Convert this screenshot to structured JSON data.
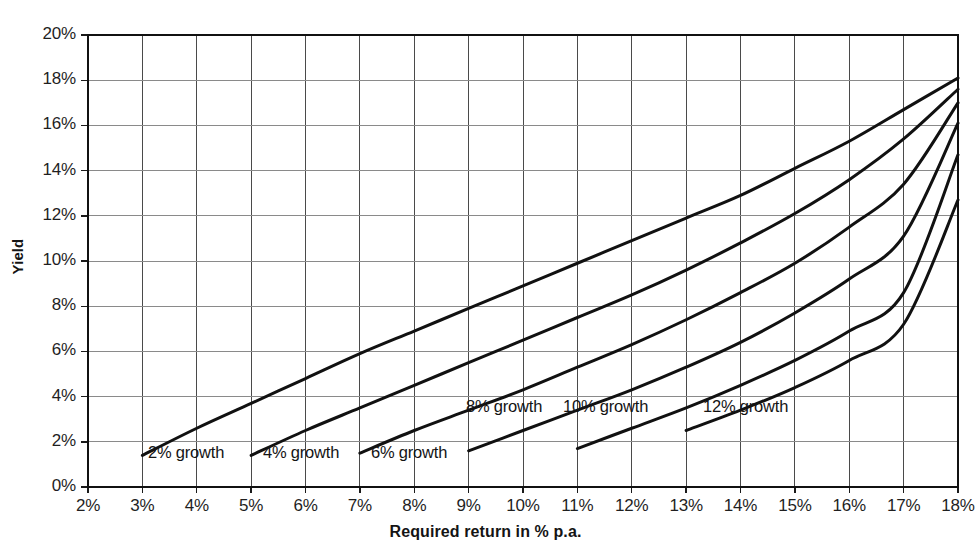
{
  "chart_data": {
    "type": "line",
    "title": "",
    "xlabel": "Required return in % p.a.",
    "ylabel": "Yield",
    "xlim": [
      2,
      18
    ],
    "ylim": [
      0,
      20
    ],
    "grid": true,
    "legend_position": "inline-labels",
    "x_tick_labels": [
      "2%",
      "3%",
      "4%",
      "5%",
      "6%",
      "7%",
      "8%",
      "9%",
      "10%",
      "11%",
      "12%",
      "13%",
      "14%",
      "15%",
      "16%",
      "17%",
      "18%"
    ],
    "y_tick_labels": [
      "0%",
      "2%",
      "4%",
      "6%",
      "8%",
      "10%",
      "12%",
      "14%",
      "16%",
      "18%",
      "20%"
    ],
    "x_ticks": [
      2,
      3,
      4,
      5,
      6,
      7,
      8,
      9,
      10,
      11,
      12,
      13,
      14,
      15,
      16,
      17,
      18
    ],
    "y_ticks": [
      0,
      2,
      4,
      6,
      8,
      10,
      12,
      14,
      16,
      18,
      20
    ],
    "series": [
      {
        "name": "2% growth",
        "label": "2% growth",
        "color": "#111111",
        "x": [
          3,
          4,
          5,
          6,
          7,
          8,
          9,
          10,
          11,
          12,
          13,
          14,
          15,
          16,
          17,
          18
        ],
        "values": [
          1.4,
          2.6,
          3.7,
          4.8,
          5.9,
          6.9,
          7.9,
          8.9,
          9.9,
          10.9,
          11.9,
          12.9,
          14.1,
          15.3,
          16.7,
          18.1
        ]
      },
      {
        "name": "4% growth",
        "label": "4% growth",
        "color": "#111111",
        "x": [
          5,
          6,
          7,
          8,
          9,
          10,
          11,
          12,
          13,
          14,
          15,
          16,
          17,
          18
        ],
        "values": [
          1.4,
          2.5,
          3.5,
          4.5,
          5.5,
          6.5,
          7.5,
          8.5,
          9.6,
          10.8,
          12.1,
          13.6,
          15.4,
          17.6
        ]
      },
      {
        "name": "6% growth",
        "label": "6% growth",
        "color": "#111111",
        "x": [
          7,
          8,
          9,
          10,
          11,
          12,
          13,
          14,
          15,
          16,
          17,
          18
        ],
        "values": [
          1.5,
          2.5,
          3.4,
          4.3,
          5.3,
          6.3,
          7.4,
          8.6,
          9.9,
          11.5,
          13.4,
          17.0
        ]
      },
      {
        "name": "8% growth",
        "label": "8% growth",
        "color": "#111111",
        "x": [
          9,
          10,
          11,
          12,
          13,
          14,
          15,
          16,
          17,
          18
        ],
        "values": [
          1.6,
          2.5,
          3.4,
          4.3,
          5.3,
          6.4,
          7.7,
          9.2,
          11.1,
          16.1
        ]
      },
      {
        "name": "10% growth",
        "label": "10% growth",
        "color": "#111111",
        "x": [
          11,
          12,
          13,
          14,
          15,
          16,
          17,
          18
        ],
        "values": [
          1.7,
          2.6,
          3.5,
          4.5,
          5.6,
          6.9,
          8.6,
          14.7
        ]
      },
      {
        "name": "12% growth",
        "label": "12% growth",
        "color": "#111111",
        "x": [
          13,
          14,
          15,
          16,
          17,
          18
        ],
        "values": [
          2.5,
          3.4,
          4.4,
          5.6,
          7.2,
          12.7
        ]
      }
    ],
    "series_label_positions": [
      {
        "label_key": 0,
        "x_px": 148,
        "y_px": 443
      },
      {
        "label_key": 1,
        "x_px": 263,
        "y_px": 443
      },
      {
        "label_key": 2,
        "x_px": 371,
        "y_px": 443
      },
      {
        "label_key": 3,
        "x_px": 466,
        "y_px": 397
      },
      {
        "label_key": 4,
        "x_px": 563,
        "y_px": 397
      },
      {
        "label_key": 5,
        "x_px": 703,
        "y_px": 397
      }
    ]
  }
}
